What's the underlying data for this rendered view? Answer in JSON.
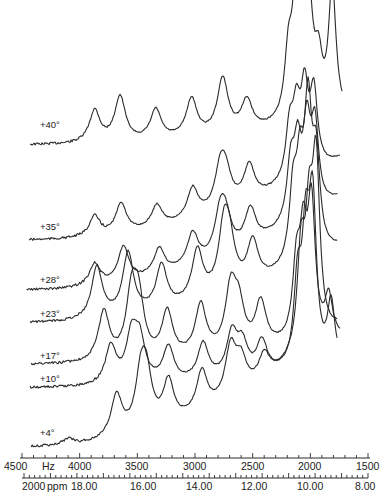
{
  "chart_data": {
    "type": "line",
    "title": "",
    "xlabel": "Hz",
    "x_secondary_label": "ppm",
    "xlim": [
      4500,
      1500
    ],
    "x_ticks_hz": [
      4500,
      4000,
      3500,
      3000,
      2500,
      2000,
      1500
    ],
    "x_tick_labels_hz": [
      "4500",
      "4000",
      "3500",
      "3000",
      "2500",
      "2000",
      "1500"
    ],
    "hz_unit_label": "Hz",
    "x_ticks_ppm": [
      "20.00",
      "18.00",
      "16.00",
      "14.00",
      "12.00",
      "10.00",
      "8.00"
    ],
    "x_tick_labels_ppm": [
      "2000",
      "18.00",
      "16.00",
      "14.00",
      "12.00",
      "10.00",
      "8.00"
    ],
    "ppm_unit_label": "ppm",
    "grid": false,
    "legend": "none",
    "series": [
      {
        "name": "+40°",
        "label_y": 124,
        "base_start": 145,
        "base_end": 120,
        "start_hz": 4430,
        "end_hz": 1720,
        "peaks": [
          [
            3870,
            32
          ],
          [
            3650,
            45
          ],
          [
            3340,
            30
          ],
          [
            3030,
            38
          ],
          [
            2760,
            55
          ],
          [
            2550,
            30
          ],
          [
            2190,
            60
          ],
          [
            2130,
            85
          ],
          [
            2070,
            118
          ],
          [
            2010,
            90
          ],
          [
            1930,
            50
          ],
          [
            1810,
            128
          ]
        ]
      },
      {
        "name": "+35°",
        "label_y": 226,
        "base_start": 240,
        "base_end": 160,
        "start_hz": 4440,
        "end_hz": 1740,
        "peaks": [
          [
            3870,
            20
          ],
          [
            3640,
            30
          ],
          [
            3330,
            22
          ],
          [
            3020,
            30
          ],
          [
            2780,
            40
          ],
          [
            2730,
            28
          ],
          [
            2530,
            35
          ],
          [
            2180,
            50
          ],
          [
            2120,
            60
          ],
          [
            2050,
            78
          ],
          [
            1970,
            75
          ]
        ]
      },
      {
        "name": "+28°",
        "label_y": 279,
        "base_start": 290,
        "base_end": 200,
        "start_hz": 4460,
        "end_hz": 1760,
        "peaks": [
          [
            3870,
            22
          ],
          [
            3620,
            35
          ],
          [
            3310,
            26
          ],
          [
            3020,
            32
          ],
          [
            2780,
            42
          ],
          [
            2730,
            28
          ],
          [
            2520,
            35
          ],
          [
            2170,
            55
          ],
          [
            2110,
            65
          ],
          [
            2030,
            82
          ],
          [
            1960,
            80
          ]
        ]
      },
      {
        "name": "+23°",
        "label_y": 313,
        "base_start": 323,
        "base_end": 250,
        "start_hz": 4430,
        "end_hz": 1760,
        "peaks": [
          [
            3850,
            52
          ],
          [
            3580,
            62
          ],
          [
            3290,
            44
          ],
          [
            2980,
            50
          ],
          [
            2750,
            60
          ],
          [
            2700,
            40
          ],
          [
            2500,
            42
          ],
          [
            2150,
            68
          ],
          [
            2090,
            80
          ],
          [
            2020,
            140
          ],
          [
            1950,
            90
          ]
        ]
      },
      {
        "name": "+17°",
        "label_y": 355,
        "base_start": 365,
        "base_end": 340,
        "start_hz": 4420,
        "end_hz": 1740,
        "peaks": [
          [
            3790,
            50
          ],
          [
            3550,
            60
          ],
          [
            3490,
            55
          ],
          [
            3240,
            45
          ],
          [
            2950,
            50
          ],
          [
            2690,
            60
          ],
          [
            2620,
            40
          ],
          [
            2430,
            45
          ],
          [
            2120,
            70
          ],
          [
            2060,
            90
          ],
          [
            1990,
            130
          ],
          [
            1840,
            40
          ]
        ]
      },
      {
        "name": "+10°",
        "label_y": 378,
        "base_start": 388,
        "base_end": 370,
        "start_hz": 4430,
        "end_hz": 1760,
        "peaks": [
          [
            3730,
            38
          ],
          [
            3550,
            45
          ],
          [
            3480,
            40
          ],
          [
            3230,
            35
          ],
          [
            2930,
            36
          ],
          [
            2680,
            42
          ],
          [
            2590,
            30
          ],
          [
            2420,
            32
          ],
          [
            2110,
            80
          ],
          [
            2040,
            115
          ],
          [
            1980,
            155
          ],
          [
            1820,
            62
          ]
        ]
      },
      {
        "name": "+4°",
        "label_y": 432,
        "base_start": 447,
        "base_end": 330,
        "start_hz": 4420,
        "end_hz": 1760,
        "peaks": [
          [
            4100,
            6
          ],
          [
            3680,
            42
          ],
          [
            3470,
            50
          ],
          [
            3420,
            48
          ],
          [
            3230,
            42
          ],
          [
            2940,
            40
          ],
          [
            2690,
            50
          ],
          [
            2600,
            30
          ],
          [
            2400,
            25
          ],
          [
            2080,
            95
          ],
          [
            2010,
            110
          ],
          [
            1950,
            170
          ]
        ]
      }
    ]
  },
  "axes": {
    "hz_axis_y": 458,
    "ppm_axis_y": 478,
    "hz_left_px": 22,
    "hz_right_px": 368,
    "ppm_left_px": 24,
    "ppm_right_px": 368
  }
}
